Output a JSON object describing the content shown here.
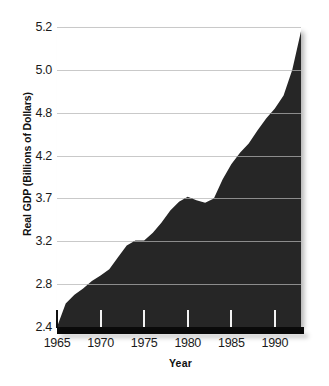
{
  "chart_data": {
    "type": "area",
    "title": "",
    "xlabel": "Year",
    "ylabel": "Real GDP (Billions of Dollars)",
    "xlim": [
      1965,
      1993
    ],
    "ylim": [
      2.4,
      5.2
    ],
    "grid": true,
    "legend": null,
    "fill_color": "#262626",
    "gridline_color": "#c9c9c9",
    "background": "#ffffff",
    "ytick_labels": [
      "2.4",
      "2.8",
      "3.2",
      "3.7",
      "4.2",
      "4.8",
      "5.0",
      "5.2"
    ],
    "ytick_values": [
      2.4,
      2.8,
      3.2,
      3.7,
      4.2,
      4.8,
      5.0,
      5.2
    ],
    "xtick_labels": [
      "1965",
      "1970",
      "1975",
      "1980",
      "1985",
      "1990"
    ],
    "xtick_values": [
      1965,
      1970,
      1975,
      1980,
      1985,
      1990
    ],
    "x": [
      1965,
      1966,
      1967,
      1968,
      1969,
      1970,
      1971,
      1972,
      1973,
      1974,
      1975,
      1976,
      1977,
      1978,
      1979,
      1980,
      1981,
      1982,
      1983,
      1984,
      1985,
      1986,
      1987,
      1988,
      1989,
      1990,
      1991,
      1992,
      1993
    ],
    "values": [
      2.4,
      2.62,
      2.7,
      2.76,
      2.83,
      2.88,
      2.94,
      3.05,
      3.16,
      3.21,
      3.21,
      3.3,
      3.42,
      3.56,
      3.66,
      3.72,
      3.68,
      3.65,
      3.7,
      3.92,
      4.1,
      4.24,
      4.37,
      4.55,
      4.72,
      4.82,
      4.88,
      5.0,
      5.18
    ],
    "annotations": [
      "Plateau near 3.2 around 1974-1975",
      "Recession dip below 3.7 around 1981-1982",
      "Sharp rise at right edge to 5.2"
    ]
  }
}
